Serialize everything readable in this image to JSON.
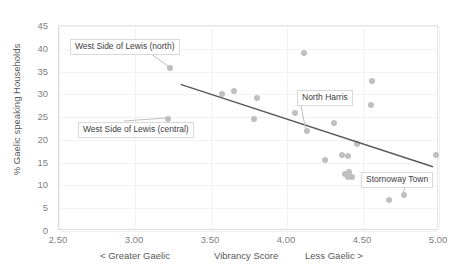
{
  "chart_data": {
    "type": "scatter",
    "title": "",
    "xlabel": "Vibrancy Score",
    "ylabel": "% Gaelic speaking Households",
    "xlim": [
      2.5,
      5.0
    ],
    "ylim": [
      0,
      45
    ],
    "xticks": [
      "2.50",
      "3.00",
      "3.50",
      "4.00",
      "4.50",
      "5.00"
    ],
    "xtick_values": [
      2.5,
      3.0,
      3.5,
      4.0,
      4.5,
      5.0
    ],
    "yticks": [
      "0",
      "5",
      "10",
      "15",
      "20",
      "25",
      "30",
      "35",
      "40",
      "45"
    ],
    "ytick_values": [
      0,
      5,
      10,
      15,
      20,
      25,
      30,
      35,
      40,
      45
    ],
    "grid": true,
    "legend": null,
    "axis_annotations": {
      "left": "< Greater Gaelic",
      "center": "Vibrancy Score",
      "right": "Less Gaelic >"
    },
    "point_color": "#bfbfbf",
    "trendline_color": "#595959",
    "points": [
      {
        "x": 3.23,
        "y": 35.8
      },
      {
        "x": 3.22,
        "y": 24.6
      },
      {
        "x": 3.57,
        "y": 30.1
      },
      {
        "x": 3.65,
        "y": 30.7
      },
      {
        "x": 3.8,
        "y": 29.3
      },
      {
        "x": 3.78,
        "y": 24.5
      },
      {
        "x": 4.05,
        "y": 26.0
      },
      {
        "x": 4.11,
        "y": 39.0
      },
      {
        "x": 4.13,
        "y": 22.0
      },
      {
        "x": 4.25,
        "y": 15.5
      },
      {
        "x": 4.31,
        "y": 23.6
      },
      {
        "x": 4.36,
        "y": 16.6
      },
      {
        "x": 4.4,
        "y": 16.5
      },
      {
        "x": 4.38,
        "y": 12.6
      },
      {
        "x": 4.41,
        "y": 12.9
      },
      {
        "x": 4.4,
        "y": 11.8
      },
      {
        "x": 4.43,
        "y": 11.9
      },
      {
        "x": 4.46,
        "y": 19.2
      },
      {
        "x": 4.55,
        "y": 27.6
      },
      {
        "x": 4.56,
        "y": 32.9
      },
      {
        "x": 4.67,
        "y": 6.9
      },
      {
        "x": 4.77,
        "y": 8.0
      },
      {
        "x": 4.98,
        "y": 16.6
      }
    ],
    "trendline": {
      "x1": 3.3,
      "y1": 32.2,
      "x2": 4.96,
      "y2": 14.1
    },
    "annotations": [
      {
        "label": "West Side of Lewis (north)",
        "point_x": 3.23,
        "point_y": 35.8
      },
      {
        "label": "West Side of Lewis (central)",
        "point_x": 3.22,
        "point_y": 24.6
      },
      {
        "label": "North Harris",
        "point_x": 4.13,
        "point_y": 22.0
      },
      {
        "label": "Stornoway Town",
        "point_x": 4.77,
        "point_y": 8.0
      }
    ]
  }
}
